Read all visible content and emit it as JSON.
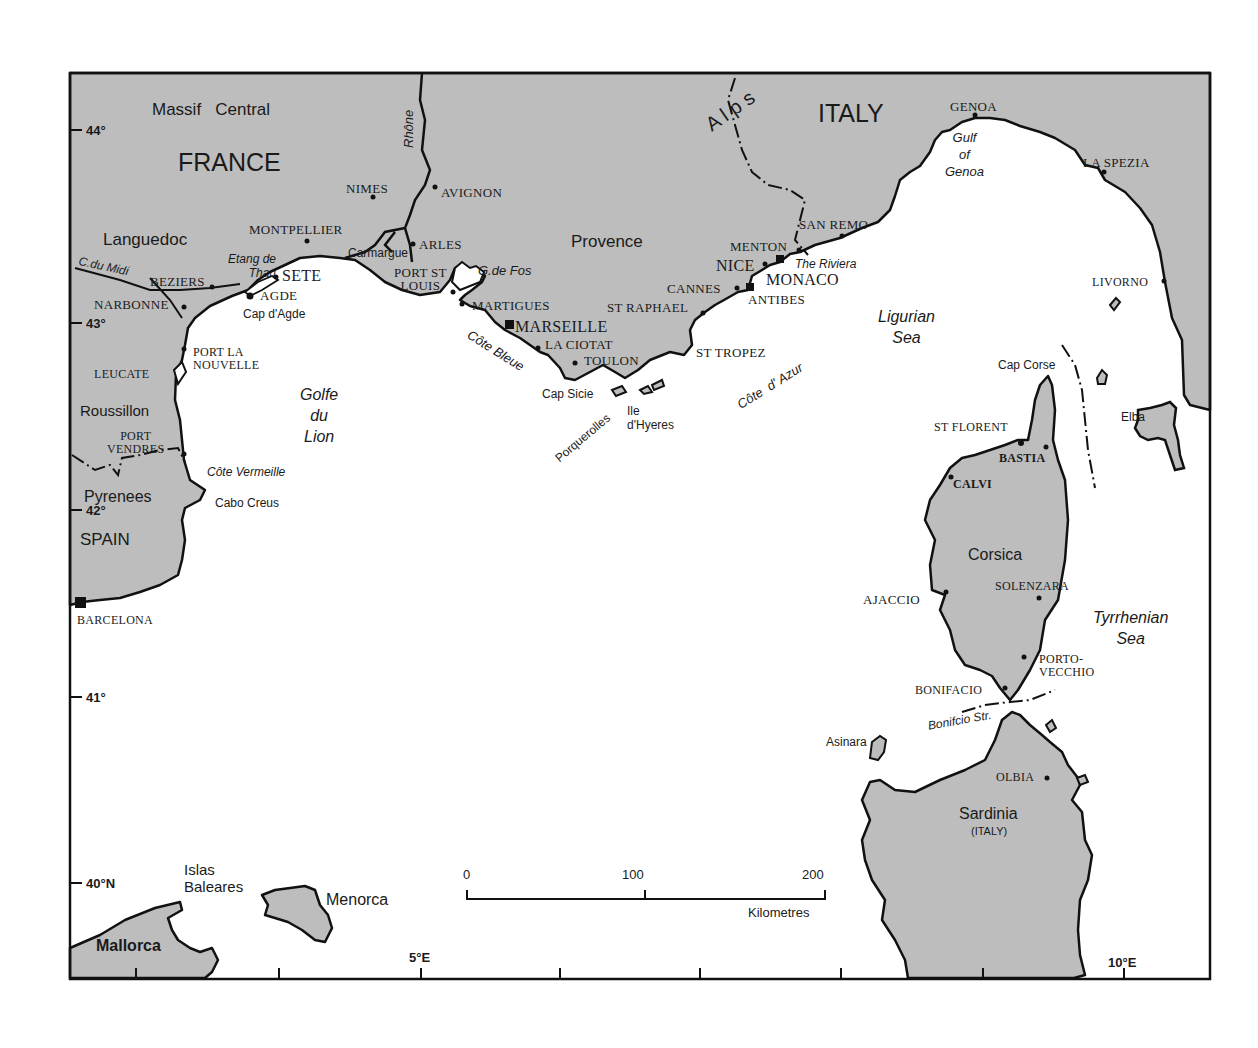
{
  "map": {
    "colors": {
      "land": "#bdbdbd",
      "sea": "#ffffff",
      "coast": "#111111",
      "frame": "#111111"
    },
    "countries": [
      {
        "id": "france",
        "label": "FRANCE"
      },
      {
        "id": "italy",
        "label": "ITALY"
      },
      {
        "id": "spain",
        "label": "SPAIN"
      }
    ],
    "regions": [
      {
        "id": "massif-central",
        "label": "Massif   Central"
      },
      {
        "id": "languedoc",
        "label": "Languedoc"
      },
      {
        "id": "provence",
        "label": "Provence"
      },
      {
        "id": "roussillon",
        "label": "Roussillon"
      },
      {
        "id": "pyrenees",
        "label": "Pyrenees"
      },
      {
        "id": "alps",
        "label": "A l p s"
      },
      {
        "id": "corsica",
        "label": "Corsica"
      },
      {
        "id": "sardinia",
        "label": "Sardinia"
      },
      {
        "id": "sardinia-sub",
        "label": "(ITALY)"
      },
      {
        "id": "mallorca",
        "label": "Mallorca"
      },
      {
        "id": "menorca",
        "label": "Menorca"
      },
      {
        "id": "islas-baleares",
        "label": "Islas\nBaleares"
      }
    ],
    "cities": [
      {
        "id": "nimes",
        "label": "NIMES"
      },
      {
        "id": "avignon",
        "label": "AVIGNON"
      },
      {
        "id": "montpellier",
        "label": "MONTPELLIER"
      },
      {
        "id": "arles",
        "label": "ARLES"
      },
      {
        "id": "beziers",
        "label": "BEZIERS"
      },
      {
        "id": "sete",
        "label": "SETE"
      },
      {
        "id": "agde",
        "label": "AGDE"
      },
      {
        "id": "narbonne",
        "label": "NARBONNE"
      },
      {
        "id": "port-st-louis",
        "label": "PORT ST\nLOUIS"
      },
      {
        "id": "martigues",
        "label": "MARTIGUES"
      },
      {
        "id": "marseille",
        "label": "MARSEILLE"
      },
      {
        "id": "la-ciotat",
        "label": "LA CIOTAT"
      },
      {
        "id": "toulon",
        "label": "TOULON"
      },
      {
        "id": "st-raphael",
        "label": "ST RAPHAEL"
      },
      {
        "id": "cannes",
        "label": "CANNES"
      },
      {
        "id": "antibes",
        "label": "ANTIBES"
      },
      {
        "id": "nice",
        "label": "NICE"
      },
      {
        "id": "monaco",
        "label": "MONACO"
      },
      {
        "id": "menton",
        "label": "MENTON"
      },
      {
        "id": "san-remo",
        "label": "SAN REMO"
      },
      {
        "id": "st-tropez",
        "label": "ST TROPEZ"
      },
      {
        "id": "genoa",
        "label": "GENOA"
      },
      {
        "id": "la-spezia",
        "label": "LA SPEZIA"
      },
      {
        "id": "livorno",
        "label": "LIVORNO"
      },
      {
        "id": "port-la-nouvelle",
        "label": "PORT LA\nNOUVELLE"
      },
      {
        "id": "leucate",
        "label": "LEUCATE"
      },
      {
        "id": "port-vendres",
        "label": "PORT\nVENDRES"
      },
      {
        "id": "barcelona",
        "label": "BARCELONA"
      },
      {
        "id": "st-florent",
        "label": "ST FLORENT"
      },
      {
        "id": "bastia",
        "label": "BASTIA"
      },
      {
        "id": "calvi",
        "label": "CALVI"
      },
      {
        "id": "ajaccio",
        "label": "AJACCIO"
      },
      {
        "id": "solenzara",
        "label": "SOLENZARA"
      },
      {
        "id": "porto-vecchio",
        "label": "PORTO-\nVECCHIO"
      },
      {
        "id": "bonifacio",
        "label": "BONIFACIO"
      },
      {
        "id": "olbia",
        "label": "OLBIA"
      }
    ],
    "features": [
      {
        "id": "rhone",
        "label": "Rhône"
      },
      {
        "id": "carmargue",
        "label": "Carmargue"
      },
      {
        "id": "c-du-midi",
        "label": "C.du Midi"
      },
      {
        "id": "etang-de-thau",
        "label": "Etang de\nThau"
      },
      {
        "id": "cap-dagde",
        "label": "Cap d'Agde"
      },
      {
        "id": "g-de-fos",
        "label": "G.de Fos"
      },
      {
        "id": "cote-bleue",
        "label": "Côte Bleue"
      },
      {
        "id": "cap-sicie",
        "label": "Cap Sicie"
      },
      {
        "id": "porquerolles",
        "label": "Porquerolles"
      },
      {
        "id": "ile-dhyeres",
        "label": "Ile\nd'Hyeres"
      },
      {
        "id": "cote-dazur",
        "label": "Côte  d' Azur"
      },
      {
        "id": "the-riviera",
        "label": "The Riviera"
      },
      {
        "id": "cote-vermeille",
        "label": "Côte Vermeille"
      },
      {
        "id": "cabo-creus",
        "label": "Cabo Creus"
      },
      {
        "id": "cap-corse",
        "label": "Cap Corse"
      },
      {
        "id": "elba",
        "label": "Elba"
      },
      {
        "id": "asinara",
        "label": "Asinara"
      },
      {
        "id": "bonifacio-str",
        "label": "Bonifcio Str."
      }
    ],
    "seas": [
      {
        "id": "golfe-du-lion",
        "label": "Golfe\ndu\nLion"
      },
      {
        "id": "gulf-of-genoa",
        "label": "Gulf\nof\nGenoa"
      },
      {
        "id": "ligurian-sea",
        "label": "Ligurian\nSea"
      },
      {
        "id": "tyrrhenian-sea",
        "label": "Tyrrhenian\nSea"
      }
    ],
    "latitude_ticks": [
      "44°",
      "43°",
      "42°",
      "41°",
      "40°N"
    ],
    "longitude_ticks": [
      "5°E",
      "10°E"
    ],
    "scale_bar": {
      "values": [
        "0",
        "100",
        "200"
      ],
      "unit": "Kilometres"
    }
  }
}
